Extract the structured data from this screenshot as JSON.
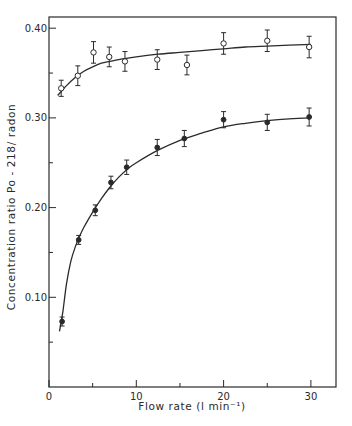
{
  "chart_data": {
    "type": "scatter",
    "title": "",
    "xlabel": "Flow rate (l min⁻¹)",
    "ylabel": "Concentration ratio  Po - 218/ radon",
    "xlim": [
      0,
      32.5
    ],
    "ylim": [
      0.0,
      0.41
    ],
    "x_ticks": [
      0,
      10,
      20,
      30
    ],
    "x_tick_labels": [
      "0",
      "10",
      "20",
      "30"
    ],
    "x_minor_ticks": [
      5,
      15,
      25
    ],
    "y_ticks": [
      0.1,
      0.2,
      0.3,
      0.4
    ],
    "y_tick_labels": [
      "0.10",
      "0.20",
      "0.30",
      "0.40"
    ],
    "y_minor_ticks": [
      0.05,
      0.15,
      0.25,
      0.35
    ],
    "grid": false,
    "legend": null,
    "series": [
      {
        "name": "open circles",
        "marker": "open-circle",
        "x": [
          1.4,
          3.3,
          5.1,
          6.9,
          8.7,
          12.4,
          15.8,
          20.0,
          25.0,
          29.8
        ],
        "y": [
          0.333,
          0.347,
          0.373,
          0.368,
          0.363,
          0.365,
          0.359,
          0.383,
          0.386,
          0.379
        ],
        "error": [
          0.009,
          0.011,
          0.012,
          0.011,
          0.011,
          0.011,
          0.011,
          0.012,
          0.012,
          0.012
        ],
        "fit_curve": {
          "x": [
            1.0,
            2.0,
            3.0,
            4.0,
            5.0,
            6.0,
            7.0,
            8.0,
            10.0,
            12.5,
            15.0,
            17.5,
            20.0,
            22.5,
            25.0,
            27.5,
            30.0
          ],
          "y": [
            0.325,
            0.336,
            0.345,
            0.352,
            0.357,
            0.361,
            0.363,
            0.365,
            0.368,
            0.371,
            0.373,
            0.375,
            0.377,
            0.379,
            0.38,
            0.381,
            0.382
          ]
        }
      },
      {
        "name": "filled circles",
        "marker": "filled-circle",
        "x": [
          1.5,
          3.4,
          5.3,
          7.1,
          8.9,
          12.4,
          15.5,
          20.0,
          25.0,
          29.8
        ],
        "y": [
          0.073,
          0.164,
          0.197,
          0.228,
          0.245,
          0.267,
          0.277,
          0.298,
          0.295,
          0.301
        ],
        "error": [
          0.005,
          0.005,
          0.006,
          0.007,
          0.008,
          0.009,
          0.009,
          0.009,
          0.009,
          0.01
        ],
        "fit_curve": {
          "x": [
            1.2,
            1.6,
            2.0,
            2.5,
            3.0,
            3.5,
            4.0,
            5.0,
            6.0,
            7.0,
            8.0,
            9.0,
            10.0,
            12.5,
            15.0,
            17.5,
            20.0,
            22.5,
            25.0,
            27.5,
            30.0
          ],
          "y": [
            0.062,
            0.085,
            0.115,
            0.14,
            0.156,
            0.168,
            0.178,
            0.195,
            0.21,
            0.223,
            0.234,
            0.243,
            0.25,
            0.264,
            0.275,
            0.283,
            0.29,
            0.294,
            0.297,
            0.299,
            0.3
          ]
        }
      }
    ],
    "colors": {
      "ink": "#2a2a2a",
      "background": "#ffffff"
    }
  }
}
